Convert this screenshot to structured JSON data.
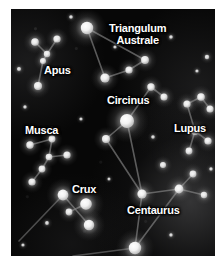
{
  "chart": {
    "type": "star-chart",
    "background_color": "#070707",
    "star_color": "#ffffff",
    "line_color": "#8d8d8d",
    "label_color": "#ffffff",
    "plate": {
      "x": 11,
      "y": 9,
      "width": 204,
      "height": 247
    }
  },
  "labels": [
    {
      "name": "Triangulum Australe",
      "line1": "Triangulum",
      "line2": "Australe",
      "x": 98,
      "y": 14,
      "two_line": true
    },
    {
      "name": "Apus",
      "line1": "Apus",
      "x": 33,
      "y": 56,
      "two_line": false
    },
    {
      "name": "Circinus",
      "line1": "Circinus",
      "x": 96,
      "y": 86,
      "two_line": false
    },
    {
      "name": "Musca",
      "line1": "Musca",
      "x": 14,
      "y": 116,
      "two_line": false
    },
    {
      "name": "Lupus",
      "line1": "Lupus",
      "x": 163,
      "y": 114,
      "two_line": false
    },
    {
      "name": "Crux",
      "line1": "Crux",
      "x": 61,
      "y": 175,
      "two_line": false
    },
    {
      "name": "Centaurus",
      "line1": "Centaurus",
      "x": 116,
      "y": 196,
      "two_line": false
    }
  ],
  "constellations": [
    {
      "name": "Triangulum Australe",
      "stars": [
        {
          "id": "ta-alpha",
          "x": 76,
          "y": 19,
          "r": 6.2,
          "brightness": 1.0
        },
        {
          "id": "ta-beta",
          "x": 94,
          "y": 69,
          "r": 4.6,
          "brightness": 0.82
        },
        {
          "id": "ta-gamma",
          "x": 118,
          "y": 61,
          "r": 3.6,
          "brightness": 0.7
        },
        {
          "id": "ta-delta",
          "x": 134,
          "y": 51,
          "r": 3.9,
          "brightness": 0.74
        }
      ],
      "lines": [
        [
          "ta-alpha",
          "ta-beta"
        ],
        [
          "ta-beta",
          "ta-gamma"
        ],
        [
          "ta-gamma",
          "ta-delta"
        ],
        [
          "ta-delta",
          "ta-alpha"
        ]
      ]
    },
    {
      "name": "Apus",
      "stars": [
        {
          "id": "ap-a",
          "x": 24,
          "y": 33,
          "r": 3.8,
          "brightness": 0.72
        },
        {
          "id": "ap-b",
          "x": 46,
          "y": 30,
          "r": 3.6,
          "brightness": 0.7
        },
        {
          "id": "ap-c",
          "x": 36,
          "y": 45,
          "r": 3.2,
          "brightness": 0.62
        },
        {
          "id": "ap-d",
          "x": 32,
          "y": 52,
          "r": 3.0,
          "brightness": 0.6
        },
        {
          "id": "ap-e",
          "x": 27,
          "y": 77,
          "r": 4.0,
          "brightness": 0.75
        }
      ],
      "lines": [
        [
          "ap-a",
          "ap-c"
        ],
        [
          "ap-b",
          "ap-c"
        ],
        [
          "ap-c",
          "ap-d"
        ],
        [
          "ap-d",
          "ap-e"
        ]
      ]
    },
    {
      "name": "Circinus",
      "stars": [
        {
          "id": "ci-alpha",
          "x": 116,
          "y": 112,
          "r": 7.0,
          "brightness": 1.0
        },
        {
          "id": "ci-beta",
          "x": 140,
          "y": 78,
          "r": 3.7,
          "brightness": 0.72
        },
        {
          "id": "ci-gamma",
          "x": 153,
          "y": 88,
          "r": 3.5,
          "brightness": 0.68
        },
        {
          "id": "ci-delta",
          "x": 95,
          "y": 130,
          "r": 4.0,
          "brightness": 0.74
        }
      ],
      "lines": [
        [
          "ci-alpha",
          "ci-beta"
        ],
        [
          "ci-beta",
          "ci-gamma"
        ],
        [
          "ci-alpha",
          "ci-delta"
        ]
      ]
    },
    {
      "name": "Musca",
      "stars": [
        {
          "id": "mu-a",
          "x": 19,
          "y": 136,
          "r": 3.7,
          "brightness": 0.7
        },
        {
          "id": "mu-b",
          "x": 41,
          "y": 130,
          "r": 3.4,
          "brightness": 0.66
        },
        {
          "id": "mu-c",
          "x": 38,
          "y": 148,
          "r": 3.3,
          "brightness": 0.64
        },
        {
          "id": "mu-d",
          "x": 56,
          "y": 146,
          "r": 3.6,
          "brightness": 0.7
        },
        {
          "id": "mu-e",
          "x": 31,
          "y": 160,
          "r": 3.4,
          "brightness": 0.66
        },
        {
          "id": "mu-f",
          "x": 21,
          "y": 173,
          "r": 3.6,
          "brightness": 0.69
        }
      ],
      "lines": [
        [
          "mu-a",
          "mu-b"
        ],
        [
          "mu-b",
          "mu-c"
        ],
        [
          "mu-c",
          "mu-d"
        ],
        [
          "mu-c",
          "mu-e"
        ],
        [
          "mu-e",
          "mu-f"
        ]
      ]
    },
    {
      "name": "Lupus",
      "stars": [
        {
          "id": "lu-a",
          "x": 176,
          "y": 95,
          "r": 3.6,
          "brightness": 0.72
        },
        {
          "id": "lu-b",
          "x": 190,
          "y": 88,
          "r": 3.8,
          "brightness": 0.76
        },
        {
          "id": "lu-c",
          "x": 199,
          "y": 100,
          "r": 3.5,
          "brightness": 0.7
        },
        {
          "id": "lu-d",
          "x": 184,
          "y": 122,
          "r": 4.0,
          "brightness": 0.78
        },
        {
          "id": "lu-e",
          "x": 197,
          "y": 132,
          "r": 3.6,
          "brightness": 0.72
        },
        {
          "id": "lu-f",
          "x": 178,
          "y": 142,
          "r": 3.4,
          "brightness": 0.68
        }
      ],
      "lines": [
        [
          "lu-a",
          "lu-b"
        ],
        [
          "lu-b",
          "lu-c"
        ],
        [
          "lu-a",
          "lu-d"
        ],
        [
          "lu-d",
          "lu-e"
        ],
        [
          "lu-d",
          "lu-f"
        ]
      ]
    },
    {
      "name": "Crux",
      "stars": [
        {
          "id": "cx-gamma",
          "x": 52,
          "y": 186,
          "r": 5.4,
          "brightness": 0.92
        },
        {
          "id": "cx-alpha",
          "x": 75,
          "y": 195,
          "r": 5.8,
          "brightness": 0.96
        },
        {
          "id": "cx-delta",
          "x": 58,
          "y": 203,
          "r": 3.4,
          "brightness": 0.64
        },
        {
          "id": "cx-beta",
          "x": 78,
          "y": 216,
          "r": 5.2,
          "brightness": 0.9
        }
      ],
      "lines": [
        [
          "cx-gamma",
          "cx-beta"
        ],
        [
          "cx-delta",
          "cx-alpha"
        ]
      ]
    },
    {
      "name": "Centaurus",
      "stars": [
        {
          "id": "ce-a",
          "x": 131,
          "y": 185,
          "r": 4.6,
          "brightness": 0.85
        },
        {
          "id": "ce-b",
          "x": 168,
          "y": 180,
          "r": 4.4,
          "brightness": 0.82
        },
        {
          "id": "ce-c",
          "x": 124,
          "y": 239,
          "r": 6.2,
          "brightness": 1.0
        },
        {
          "id": "ce-d",
          "x": 182,
          "y": 165,
          "r": 3.4,
          "brightness": 0.66
        },
        {
          "id": "ce-e",
          "x": 193,
          "y": 186,
          "r": 3.2,
          "brightness": 0.62
        },
        {
          "id": "ce-f",
          "x": 152,
          "y": 156,
          "r": 3.0,
          "brightness": 0.6
        }
      ],
      "lines": [
        [
          "ce-a",
          "ce-b"
        ],
        [
          "ce-a",
          "ce-c"
        ],
        [
          "ce-b",
          "ce-c"
        ],
        [
          "ce-b",
          "ce-d"
        ],
        [
          "ce-b",
          "ce-e"
        ],
        [
          "ce-a",
          "ci-alpha"
        ],
        [
          "ce-a",
          "ci-delta"
        ]
      ]
    }
  ],
  "field_stars": [
    {
      "x": 8,
      "y": 60,
      "r": 2.0,
      "brightness": 0.4
    },
    {
      "x": 60,
      "y": 8,
      "r": 1.8,
      "brightness": 0.35
    },
    {
      "x": 104,
      "y": 38,
      "r": 1.6,
      "brightness": 0.3
    },
    {
      "x": 160,
      "y": 28,
      "r": 1.8,
      "brightness": 0.34
    },
    {
      "x": 196,
      "y": 48,
      "r": 2.2,
      "brightness": 0.42
    },
    {
      "x": 14,
      "y": 98,
      "r": 1.7,
      "brightness": 0.33
    },
    {
      "x": 70,
      "y": 110,
      "r": 1.6,
      "brightness": 0.3
    },
    {
      "x": 142,
      "y": 128,
      "r": 1.8,
      "brightness": 0.34
    },
    {
      "x": 200,
      "y": 160,
      "r": 1.7,
      "brightness": 0.32
    },
    {
      "x": 36,
      "y": 214,
      "r": 1.9,
      "brightness": 0.36
    },
    {
      "x": 98,
      "y": 170,
      "r": 1.5,
      "brightness": 0.28
    },
    {
      "x": 160,
      "y": 226,
      "r": 1.7,
      "brightness": 0.32
    },
    {
      "x": 12,
      "y": 236,
      "r": 1.6,
      "brightness": 0.3
    },
    {
      "x": 186,
      "y": 62,
      "r": 1.6,
      "brightness": 0.3
    }
  ],
  "extra_lines": [
    {
      "name": "crux-to-lower-left",
      "x1": 52,
      "y1": 186,
      "x2": 8,
      "y2": 232
    },
    {
      "name": "centaurus-lower-tail",
      "x1": 124,
      "y1": 239,
      "x2": 62,
      "y2": 247
    }
  ]
}
